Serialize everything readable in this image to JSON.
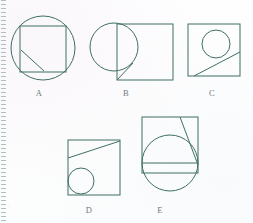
{
  "page": {
    "background_color": "#fdfdfe",
    "stroke_color": "#3f6f63",
    "label_color": "#6d7b7b",
    "stray_mark": "·"
  },
  "binding": {
    "name": "notebook-perforation-strip",
    "color": "#96aab2",
    "style": "dotted"
  },
  "figures": [
    {
      "id": "A",
      "label": "A",
      "label_x": 39,
      "label_y": 88,
      "description": "Circle with an inscribed square whose corners extend slightly past the circle, plus a diagonal segment from the left side of the square down to its bottom side.",
      "shapes": {
        "circle": {
          "cx": 43,
          "cy": 48,
          "r": 32
        },
        "square": {
          "x": 20,
          "y": 26,
          "width": 46,
          "height": 46
        },
        "diagonal": {
          "x1": 21,
          "y1": 50,
          "x2": 44,
          "y2": 71
        }
      }
    },
    {
      "id": "B",
      "label": "B",
      "label_x": 126,
      "label_y": 88,
      "description": "Square with a circle straddling its left edge, and a short diagonal from the circle's lower arc to the square's bottom-left corner.",
      "shapes": {
        "square": {
          "x": 117,
          "y": 24,
          "width": 56,
          "height": 56
        },
        "circle": {
          "cx": 114,
          "cy": 47,
          "r": 24
        },
        "diagonal": {
          "x1": 133,
          "y1": 63,
          "x2": 117,
          "y2": 80
        }
      }
    },
    {
      "id": "C",
      "label": "C",
      "label_x": 212,
      "label_y": 88,
      "description": "Square containing a circle in the upper middle area, with a diagonal line from the bottom-left running up to the right edge, tangent to the circle.",
      "shapes": {
        "square": {
          "x": 188,
          "y": 24,
          "width": 52,
          "height": 52
        },
        "circle": {
          "cx": 216,
          "cy": 44,
          "r": 14
        },
        "diagonal": {
          "x1": 194,
          "y1": 76,
          "x2": 240,
          "y2": 52
        }
      }
    },
    {
      "id": "D",
      "label": "D",
      "label_x": 89,
      "label_y": 205,
      "description": "Square with a small circle tangent to the left and bottom edges, and a diagonal from the left edge rising to the top-right corner.",
      "shapes": {
        "square": {
          "x": 68,
          "y": 140,
          "width": 52,
          "height": 55
        },
        "circle": {
          "cx": 81,
          "cy": 181,
          "r": 13
        },
        "diagonal": {
          "x1": 68,
          "y1": 158,
          "x2": 120,
          "y2": 141
        }
      }
    },
    {
      "id": "E",
      "label": "E",
      "label_x": 160,
      "label_y": 205,
      "description": "Square with a large circle extending below its bottom edge, a horizontal chord across the circle, and a diagonal from the top edge down to the right edge.",
      "shapes": {
        "square": {
          "x": 142,
          "y": 117,
          "width": 56,
          "height": 56
        },
        "circle": {
          "cx": 170,
          "cy": 163,
          "r": 28
        },
        "chord": {
          "x1": 142,
          "y1": 163,
          "x2": 198,
          "y2": 163
        },
        "diagonal": {
          "x1": 180,
          "y1": 117,
          "x2": 198,
          "y2": 165
        }
      }
    }
  ]
}
